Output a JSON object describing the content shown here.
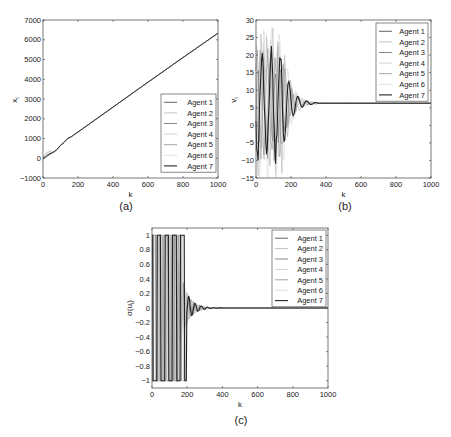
{
  "figure": {
    "panels": [
      {
        "id": "a",
        "caption": "(a)"
      },
      {
        "id": "b",
        "caption": "(b)"
      },
      {
        "id": "c",
        "caption": "(c)"
      }
    ]
  },
  "chart_data": [
    {
      "panel": "(a)",
      "type": "line",
      "title": "",
      "xlabel": "k",
      "ylabel": "x_i",
      "xlim": [
        0,
        1000
      ],
      "ylim": [
        -1000,
        7000
      ],
      "xticks": [
        0,
        200,
        400,
        600,
        800,
        1000
      ],
      "yticks": [
        -1000,
        0,
        1000,
        2000,
        3000,
        4000,
        5000,
        6000,
        7000
      ],
      "grid": false,
      "legend_position": "lower right",
      "legend": [
        "Agent 1",
        "Agent 2",
        "Agent 3",
        "Agent 4",
        "Agent 5",
        "Agent 6",
        "Agent 7"
      ],
      "series": [
        {
          "name": "Agent 1",
          "x": [
            0,
            20,
            40,
            60,
            80,
            100,
            120,
            140,
            160,
            200,
            400,
            600,
            800,
            1000
          ],
          "values": [
            0,
            150,
            250,
            300,
            450,
            650,
            800,
            1000,
            1080,
            1330,
            2590,
            3850,
            5100,
            6330
          ]
        },
        {
          "name": "Agent 2",
          "x": [
            0,
            20,
            40,
            60,
            80,
            100,
            120,
            140,
            160,
            200,
            400,
            600,
            800,
            1000
          ],
          "values": [
            -50,
            300,
            350,
            280,
            420,
            680,
            820,
            1010,
            1080,
            1330,
            2590,
            3850,
            5100,
            6330
          ]
        },
        {
          "name": "Agent 3",
          "x": [
            0,
            20,
            40,
            60,
            80,
            100,
            120,
            140,
            160,
            200,
            400,
            600,
            800,
            1000
          ],
          "values": [
            50,
            100,
            200,
            320,
            460,
            640,
            790,
            990,
            1080,
            1330,
            2590,
            3850,
            5100,
            6330
          ]
        },
        {
          "name": "Agent 4",
          "x": [
            0,
            20,
            40,
            60,
            80,
            100,
            120,
            140,
            160,
            200,
            400,
            600,
            800,
            1000
          ],
          "values": [
            -100,
            250,
            380,
            300,
            430,
            670,
            810,
            1000,
            1080,
            1330,
            2590,
            3850,
            5100,
            6330
          ]
        },
        {
          "name": "Agent 5",
          "x": [
            0,
            20,
            40,
            60,
            80,
            100,
            120,
            140,
            160,
            200,
            400,
            600,
            800,
            1000
          ],
          "values": [
            20,
            120,
            220,
            310,
            440,
            650,
            800,
            995,
            1080,
            1330,
            2590,
            3850,
            5100,
            6330
          ]
        },
        {
          "name": "Agent 6",
          "x": [
            0,
            20,
            40,
            60,
            80,
            100,
            120,
            140,
            160,
            200,
            400,
            600,
            800,
            1000
          ],
          "values": [
            -80,
            200,
            320,
            290,
            430,
            660,
            805,
            1000,
            1080,
            1330,
            2590,
            3850,
            5100,
            6330
          ]
        },
        {
          "name": "Agent 7",
          "x": [
            0,
            20,
            40,
            60,
            80,
            100,
            120,
            140,
            160,
            200,
            400,
            600,
            800,
            1000
          ],
          "values": [
            0,
            80,
            230,
            300,
            450,
            650,
            800,
            1000,
            1080,
            1330,
            2590,
            3850,
            5100,
            6330
          ]
        }
      ],
      "colors": [
        "#555555",
        "#bbbbbb",
        "#777777",
        "#cccccc",
        "#999999",
        "#dddddd",
        "#222222"
      ]
    },
    {
      "panel": "(b)",
      "type": "line",
      "title": "",
      "xlabel": "k",
      "ylabel": "v_i",
      "xlim": [
        0,
        1000
      ],
      "ylim": [
        -15,
        30
      ],
      "xticks": [
        0,
        200,
        400,
        600,
        800,
        1000
      ],
      "yticks": [
        -15,
        -10,
        -5,
        0,
        5,
        10,
        15,
        20,
        25,
        30
      ],
      "grid": false,
      "legend_position": "upper right",
      "legend": [
        "Agent 1",
        "Agent 2",
        "Agent 3",
        "Agent 4",
        "Agent 5",
        "Agent 6",
        "Agent 7"
      ],
      "consensus_value": 6.3,
      "settling_k": 350,
      "envelope": {
        "max_peak": 26,
        "min_trough": -12,
        "decay_until_k": 350
      },
      "colors": [
        "#555555",
        "#bbbbbb",
        "#777777",
        "#cccccc",
        "#999999",
        "#dddddd",
        "#222222"
      ]
    },
    {
      "panel": "(c)",
      "type": "line",
      "title": "",
      "xlabel": "k",
      "ylabel": "σ(u_i)",
      "xlim": [
        0,
        1000
      ],
      "ylim": [
        -1.1,
        1.1
      ],
      "xticks": [
        0,
        200,
        400,
        600,
        800,
        1000
      ],
      "yticks": [
        -1,
        -0.8,
        -0.6,
        -0.4,
        -0.2,
        0,
        0.2,
        0.4,
        0.6,
        0.8,
        1
      ],
      "grid": false,
      "legend_position": "upper right",
      "legend": [
        "Agent 1",
        "Agent 2",
        "Agent 3",
        "Agent 4",
        "Agent 5",
        "Agent 6",
        "Agent 7"
      ],
      "consensus_value": 0,
      "saturated_until_k": 150,
      "settling_k": 400,
      "colors": [
        "#555555",
        "#bbbbbb",
        "#777777",
        "#cccccc",
        "#999999",
        "#dddddd",
        "#222222"
      ]
    }
  ]
}
